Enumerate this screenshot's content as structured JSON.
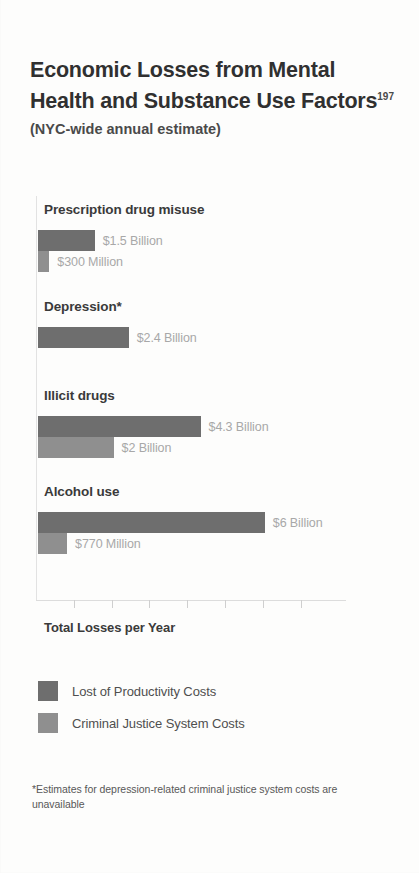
{
  "chart_data": {
    "type": "bar",
    "orientation": "horizontal",
    "title": "Economic Losses from Mental Health and Substance Use Factors",
    "title_superscript": "197",
    "subtitle": "(NYC-wide annual estimate)",
    "xlabel": "Total Losses per Year",
    "ylabel": "",
    "xlim": [
      0,
      7
    ],
    "x_unit": "Billions of dollars",
    "x_tick_values": [
      1,
      2,
      3,
      4,
      5,
      6,
      7
    ],
    "x_tick_labels": [
      "",
      "",
      "",
      "",
      "",
      "",
      ""
    ],
    "grid": false,
    "legend_position": "bottom-left",
    "categories": [
      "Prescription drug misuse",
      "Depression*",
      "Illicit drugs",
      "Alcohol use"
    ],
    "series": [
      {
        "name": "Lost of Productivity Costs",
        "color": "#6e6e6e",
        "values": [
          1.5,
          2.4,
          4.3,
          6.0
        ],
        "value_labels": [
          "$1.5 Billion",
          "$2.4 Billion",
          "$4.3 Billion",
          "$6 Billion"
        ]
      },
      {
        "name": "Criminal Justice System Costs",
        "color": "#8f8f8f",
        "values": [
          0.3,
          null,
          2.0,
          0.77
        ],
        "value_labels": [
          "$300 Million",
          null,
          "$2 Billion",
          "$770 Million"
        ]
      }
    ],
    "annotations": [
      "*Estimates for depression-related criminal justice system costs are unavailable"
    ]
  },
  "groups": [
    {
      "label": "Prescription drug misuse",
      "bars": [
        {
          "series": "productivity",
          "value": 1.5,
          "value_label": "$1.5 Billion"
        },
        {
          "series": "justice",
          "value": 0.3,
          "value_label": "$300 Million"
        }
      ]
    },
    {
      "label": "Depression*",
      "bars": [
        {
          "series": "productivity",
          "value": 2.4,
          "value_label": "$2.4 Billion"
        }
      ]
    },
    {
      "label": "Illicit drugs",
      "bars": [
        {
          "series": "productivity",
          "value": 4.3,
          "value_label": "$4.3 Billion"
        },
        {
          "series": "justice",
          "value": 2.0,
          "value_label": "$2 Billion"
        }
      ]
    },
    {
      "label": "Alcohol use",
      "bars": [
        {
          "series": "productivity",
          "value": 6.0,
          "value_label": "$6 Billion"
        },
        {
          "series": "justice",
          "value": 0.77,
          "value_label": "$770 Million"
        }
      ]
    }
  ],
  "legend": [
    {
      "label": "Lost of Productivity Costs",
      "series": "productivity",
      "color": "#6e6e6e"
    },
    {
      "label": "Criminal Justice System Costs",
      "series": "justice",
      "color": "#8f8f8f"
    }
  ],
  "footnote": "*Estimates for depression-related criminal justice system costs are unavailable",
  "colors": {
    "productivity": "#6e6e6e",
    "justice": "#8f8f8f",
    "value_label": "#a8a8a8",
    "category_label": "#3a3a3a",
    "title": "#303030",
    "background": "#fdfdfc"
  }
}
